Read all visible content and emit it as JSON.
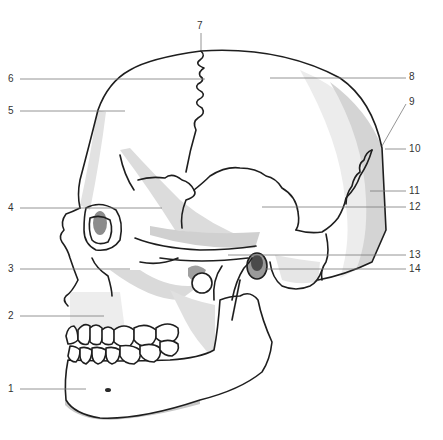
{
  "diagram": {
    "colors": {
      "background": "#ffffff",
      "outline": "#1e1e1e",
      "shade_light": "#ececec",
      "shade_mid": "#d4d4d4",
      "shade_dark": "#a8a8a8",
      "shade_darkest": "#555555",
      "leader_line": "#7a7a7a",
      "label_text": "#333333"
    },
    "labels": [
      {
        "id": "1",
        "text": "1",
        "side": "left",
        "x": 8,
        "y": 385
      },
      {
        "id": "2",
        "text": "2",
        "side": "left",
        "x": 8,
        "y": 312
      },
      {
        "id": "3",
        "text": "3",
        "side": "left",
        "x": 8,
        "y": 266
      },
      {
        "id": "4",
        "text": "4",
        "side": "left",
        "x": 8,
        "y": 204
      },
      {
        "id": "5",
        "text": "5",
        "side": "left",
        "x": 8,
        "y": 108
      },
      {
        "id": "6",
        "text": "6",
        "side": "left",
        "x": 8,
        "y": 75
      },
      {
        "id": "7",
        "text": "7",
        "side": "top",
        "x": 196,
        "y": 22
      },
      {
        "id": "8",
        "text": "8",
        "side": "right",
        "x": 410,
        "y": 72
      },
      {
        "id": "9",
        "text": "9",
        "side": "right",
        "x": 410,
        "y": 98
      },
      {
        "id": "10",
        "text": "10",
        "side": "right",
        "x": 410,
        "y": 145
      },
      {
        "id": "11",
        "text": "11",
        "side": "right",
        "x": 410,
        "y": 185
      },
      {
        "id": "12",
        "text": "12",
        "side": "right",
        "x": 410,
        "y": 202
      },
      {
        "id": "13",
        "text": "13",
        "side": "right",
        "x": 410,
        "y": 250
      },
      {
        "id": "14",
        "text": "14",
        "side": "right",
        "x": 410,
        "y": 264
      }
    ]
  }
}
